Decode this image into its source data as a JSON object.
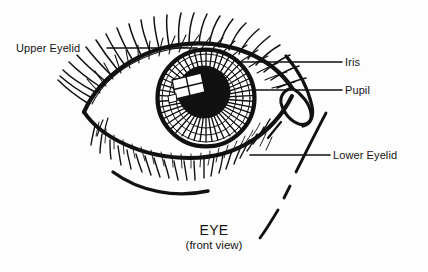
{
  "figure": {
    "kind": "anatomical-line-drawing",
    "view": "front view",
    "ink_color": "#111111",
    "background_color": "#fdfdfd",
    "highlight_color": "#ffffff"
  },
  "labels": {
    "upper_eyelid": "Upper Eyelid",
    "iris": "Iris",
    "pupil": "Pupil",
    "lower_eyelid": "Lower Eyelid"
  },
  "caption": {
    "title": "EYE",
    "subtitle": "(front view)"
  },
  "parts": {
    "upper_eyelid": "upper-eyelid-line",
    "upper_lashes": "upper-eyelash-set",
    "lower_eyelid": "lower-eyelid-line",
    "lower_lashes": "lower-eyelash-set",
    "lower_crease": "lower-eyelid-crease-arc",
    "iris": "iris-disc",
    "iris_striations": "iris-radial-striations",
    "pupil": "pupil-disc",
    "catchlight": "window-pane-catchlight",
    "caruncle": "inner-canthus-tear-duct",
    "nose_contour": "nose-bridge-contour"
  }
}
